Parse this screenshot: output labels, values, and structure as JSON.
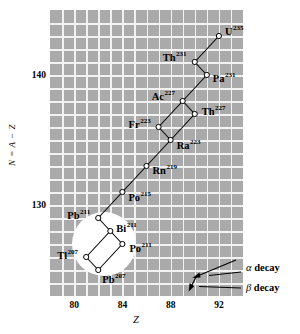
{
  "figure": {
    "kind": "nuclide-decay-chain-scatter",
    "panel": {
      "bg_color": "#aaaaaa",
      "grid_color": "#f2f2f2"
    }
  },
  "axes": {
    "x": {
      "label": "Z",
      "ticks": [
        "80",
        "84",
        "88",
        "92"
      ],
      "tick_values": [
        80,
        84,
        88,
        92
      ],
      "range": [
        78,
        94
      ]
    },
    "y": {
      "label": "N = A − Z",
      "ticks": [
        "140",
        "130"
      ],
      "tick_values": [
        140,
        130
      ],
      "range": [
        123,
        145
      ]
    }
  },
  "legend": {
    "alpha": {
      "symbol": "α",
      "text": " decay"
    },
    "beta": {
      "symbol": "β",
      "text": " decay"
    }
  },
  "chart_data": {
    "type": "scatter",
    "title": "",
    "xlabel": "Z",
    "ylabel": "N = A − Z",
    "xlim": [
      78,
      94
    ],
    "ylim": [
      123,
      145
    ],
    "grid": true,
    "legend_position": "bottom-right",
    "series": [
      {
        "name": "Actinium series (4n+3) nuclides",
        "points": [
          {
            "element": "U",
            "mass": "235",
            "Z": 92,
            "N": 143
          },
          {
            "element": "Th",
            "mass": "231",
            "Z": 90,
            "N": 141
          },
          {
            "element": "Pa",
            "mass": "231",
            "Z": 91,
            "N": 140
          },
          {
            "element": "Ac",
            "mass": "227",
            "Z": 89,
            "N": 138
          },
          {
            "element": "Th",
            "mass": "227",
            "Z": 90,
            "N": 137
          },
          {
            "element": "Fr",
            "mass": "223",
            "Z": 87,
            "N": 136
          },
          {
            "element": "Ra",
            "mass": "223",
            "Z": 88,
            "N": 135
          },
          {
            "element": "Rn",
            "mass": "219",
            "Z": 86,
            "N": 133
          },
          {
            "element": "Po",
            "mass": "215",
            "Z": 84,
            "N": 131
          },
          {
            "element": "Pb",
            "mass": "211",
            "Z": 82,
            "N": 129
          },
          {
            "element": "Bi",
            "mass": "211",
            "Z": 83,
            "N": 128
          },
          {
            "element": "Tl",
            "mass": "207",
            "Z": 81,
            "N": 126
          },
          {
            "element": "Po",
            "mass": "211",
            "Z": 84,
            "N": 127
          },
          {
            "element": "Pb",
            "mass": "207",
            "Z": 82,
            "N": 125
          }
        ],
        "transitions": [
          {
            "from": "U235",
            "to": "Th231",
            "mode": "alpha"
          },
          {
            "from": "Th231",
            "to": "Pa231",
            "mode": "beta"
          },
          {
            "from": "Pa231",
            "to": "Ac227",
            "mode": "alpha"
          },
          {
            "from": "Ac227",
            "to": "Fr223",
            "mode": "alpha"
          },
          {
            "from": "Ac227",
            "to": "Th227",
            "mode": "beta"
          },
          {
            "from": "Fr223",
            "to": "Ra223",
            "mode": "beta"
          },
          {
            "from": "Th227",
            "to": "Ra223",
            "mode": "alpha"
          },
          {
            "from": "Ra223",
            "to": "Rn219",
            "mode": "alpha"
          },
          {
            "from": "Rn219",
            "to": "Po215",
            "mode": "alpha"
          },
          {
            "from": "Po215",
            "to": "Pb211",
            "mode": "alpha"
          },
          {
            "from": "Pb211",
            "to": "Bi211",
            "mode": "beta"
          },
          {
            "from": "Bi211",
            "to": "Tl207",
            "mode": "alpha"
          },
          {
            "from": "Bi211",
            "to": "Po211",
            "mode": "beta"
          },
          {
            "from": "Tl207",
            "to": "Pb207",
            "mode": "beta"
          },
          {
            "from": "Po211",
            "to": "Pb207",
            "mode": "alpha"
          }
        ]
      }
    ],
    "labels": [
      {
        "id": "U235",
        "element": "U",
        "mass": "235"
      },
      {
        "id": "Th231",
        "element": "Th",
        "mass": "231"
      },
      {
        "id": "Pa231",
        "element": "Pa",
        "mass": "231"
      },
      {
        "id": "Ac227",
        "element": "Ac",
        "mass": "227"
      },
      {
        "id": "Th227",
        "element": "Th",
        "mass": "227"
      },
      {
        "id": "Fr223",
        "element": "Fr",
        "mass": "223"
      },
      {
        "id": "Ra223",
        "element": "Ra",
        "mass": "223"
      },
      {
        "id": "Rn219",
        "element": "Rn",
        "mass": "219"
      },
      {
        "id": "Po215",
        "element": "Po",
        "mass": "215"
      },
      {
        "id": "Pb211",
        "element": "Pb",
        "mass": "211"
      },
      {
        "id": "Bi211",
        "element": "Bi",
        "mass": "211"
      },
      {
        "id": "Tl207",
        "element": "Tl",
        "mass": "207"
      },
      {
        "id": "Po211",
        "element": "Po",
        "mass": "211"
      },
      {
        "id": "Pb207",
        "element": "Pb",
        "mass": "207"
      }
    ],
    "annotations": [
      {
        "id": "alpha-decay",
        "text": "α decay"
      },
      {
        "id": "beta-decay",
        "text": "β decay"
      }
    ]
  },
  "nuclide_text": {
    "U235": {
      "el": "U",
      "sup": "235"
    },
    "Th231": {
      "el": "Th",
      "sup": "231"
    },
    "Pa231": {
      "el": "Pa",
      "sup": "231"
    },
    "Ac227": {
      "el": "Ac",
      "sup": "227"
    },
    "Th227": {
      "el": "Th",
      "sup": "227"
    },
    "Fr223": {
      "el": "Fr",
      "sup": "223"
    },
    "Ra223": {
      "el": "Ra",
      "sup": "223"
    },
    "Rn219": {
      "el": "Rn",
      "sup": "219"
    },
    "Po215": {
      "el": "Po",
      "sup": "215"
    },
    "Pb211": {
      "el": "Pb",
      "sup": "211"
    },
    "Bi211": {
      "el": "Bi",
      "sup": "211"
    },
    "Tl207": {
      "el": "Tl",
      "sup": "207"
    },
    "Po211": {
      "el": "Po",
      "sup": "211"
    },
    "Pb207": {
      "el": "Pb",
      "sup": "207"
    }
  }
}
